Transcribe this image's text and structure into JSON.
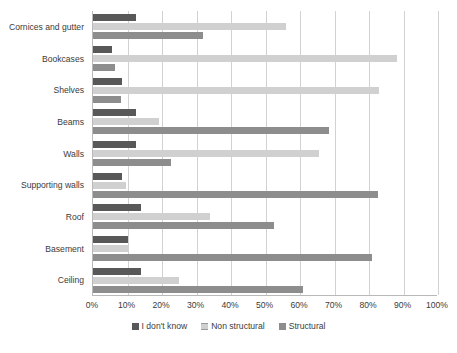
{
  "chart_data": {
    "type": "bar",
    "orientation": "horizontal",
    "title": "",
    "xlabel": "",
    "ylabel": "",
    "xlim": [
      0,
      100
    ],
    "xticks": [
      "0%",
      "10%",
      "20%",
      "30%",
      "40%",
      "50%",
      "60%",
      "70%",
      "80%",
      "90%",
      "100%"
    ],
    "xtick_values": [
      0,
      10,
      20,
      30,
      40,
      50,
      60,
      70,
      80,
      90,
      100
    ],
    "grid": true,
    "legend_position": "bottom",
    "categories": [
      "Cornices and gutter",
      "Bookcases",
      "Shelves",
      "Beams",
      "Walls",
      "Supporting walls",
      "Roof",
      "Basement",
      "Ceiling"
    ],
    "series": [
      {
        "name": "I don't know",
        "color": "#585858",
        "values": [
          12.5,
          5.5,
          8.5,
          12.5,
          12.5,
          8.5,
          14,
          10,
          14
        ]
      },
      {
        "name": "Non structural",
        "color": "#d0d0d0",
        "values": [
          56,
          88,
          83,
          19,
          65.5,
          9.5,
          34,
          10,
          25
        ]
      },
      {
        "name": "Structural",
        "color": "#8d8d8d",
        "values": [
          32,
          6.5,
          8,
          68.5,
          22.5,
          82.5,
          52.5,
          81,
          61
        ]
      }
    ]
  },
  "legend": {
    "items": [
      {
        "label": "I don't know"
      },
      {
        "label": "Non structural"
      },
      {
        "label": "Structural"
      }
    ]
  }
}
